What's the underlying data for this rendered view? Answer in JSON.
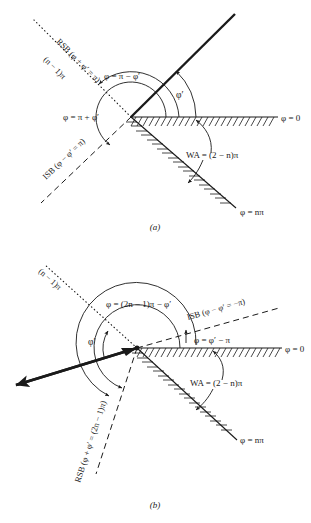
{
  "figure": {
    "type": "wedge-diffraction-geometry",
    "background": "#ffffff",
    "ink": "#1a1a1a",
    "panels": [
      {
        "id": "a",
        "caption": "(a)",
        "vertex": [
          131,
          117
        ],
        "labels": {
          "rsb": "RSB (φ + φ′ = π)",
          "n_minus_1_pi": "(n − 1)π",
          "phi_pi_minus_phip": "φ = π − φ′",
          "phi_pi_plus_phip": "φ = π + φ′",
          "phip": "φ′",
          "isb": "ISB (φ − φ′ = π)",
          "phi_zero": "φ = 0",
          "wa": "WA = (2 − n)π",
          "phi_npi": "φ = nπ"
        }
      },
      {
        "id": "b",
        "caption": "(b)",
        "vertex": [
          137,
          348
        ],
        "labels": {
          "n_minus_1_pi": "(n − 1)π",
          "phi_2n_minus_1": "φ = (2n − 1)π − φ′",
          "isb": "ISB (φ − φ′ = −π)",
          "phi_phip_minus_pi": "φ = φ′ − π",
          "phip": "φ′",
          "phi_zero": "φ = 0",
          "wa": "WA = (2 − n)π",
          "phi_npi": "φ = nπ",
          "rsb": "RSB (φ + φ′ = (2n − 1)π)"
        }
      }
    ]
  }
}
